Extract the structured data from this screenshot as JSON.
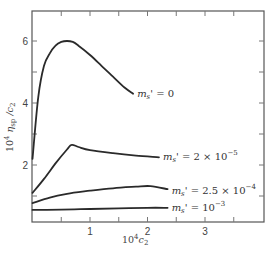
{
  "chart_data": {
    "type": "line",
    "title": "",
    "xlabel": "10^4 c2",
    "ylabel": "10^4 η_sp / c2",
    "xlim": [
      0,
      4.0
    ],
    "ylim": [
      0.15,
      6.95
    ],
    "x_ticks_major": [
      1,
      2,
      3
    ],
    "x_ticks_minor": [
      0.5,
      1.5,
      2.5,
      3.5
    ],
    "y_ticks_major": [
      2,
      4,
      6
    ],
    "y_ticks_minor": [
      1,
      3,
      5
    ],
    "grid": false,
    "legend": "inline labels at curve ends",
    "series": [
      {
        "name": "ms' = 0",
        "label_main": "m",
        "label_sub": "s",
        "label_rest": "' = 0",
        "x": [
          0.0,
          0.1,
          0.2,
          0.3,
          0.4,
          0.5,
          0.6,
          0.7,
          0.8,
          1.0,
          1.2,
          1.4,
          1.6,
          1.75
        ],
        "y": [
          2.2,
          4.2,
          5.2,
          5.6,
          5.85,
          5.97,
          6.0,
          5.97,
          5.85,
          5.55,
          5.2,
          4.85,
          4.5,
          4.3
        ]
      },
      {
        "name": "ms' = 2 × 10^-5",
        "label_main": "m",
        "label_sub": "s",
        "label_rest": "' = 2 × 10",
        "label_exp": "−5",
        "x": [
          0.0,
          0.2,
          0.4,
          0.6,
          0.68,
          0.8,
          1.0,
          1.4,
          1.8,
          2.2
        ],
        "y": [
          1.1,
          1.55,
          2.05,
          2.5,
          2.65,
          2.58,
          2.48,
          2.38,
          2.3,
          2.25
        ]
      },
      {
        "name": "ms' = 2.5 × 10^-4",
        "label_main": "m",
        "label_sub": "s",
        "label_rest": "' = 2.5 × 10",
        "label_exp": "−4",
        "x": [
          0.0,
          0.3,
          0.6,
          1.0,
          1.4,
          1.8,
          2.05,
          2.35
        ],
        "y": [
          0.77,
          0.95,
          1.07,
          1.17,
          1.25,
          1.3,
          1.32,
          1.22
        ]
      },
      {
        "name": "ms' = 10^-3",
        "label_main": "m",
        "label_sub": "s",
        "label_rest": "' = 10",
        "label_exp": "−3",
        "x": [
          0.0,
          0.5,
          1.0,
          1.5,
          2.0,
          2.35
        ],
        "y": [
          0.55,
          0.56,
          0.58,
          0.6,
          0.62,
          0.62
        ]
      }
    ]
  },
  "axes": {
    "y_label_prefix": "10",
    "y_label_exp": "4",
    "y_label_eta": " η",
    "y_label_eta_sub": "sp",
    "y_label_rest": " /c",
    "y_label_c_sub": "2",
    "x_label_prefix": "10",
    "x_label_exp": "4",
    "x_label_c": "c",
    "x_label_c_sub": "2",
    "x_tick_labels": [
      "1",
      "2",
      "3"
    ],
    "y_tick_labels": [
      "2",
      "4",
      "6"
    ]
  },
  "colors": {
    "line": "#2a2a2a",
    "frame": "#555555",
    "background": "#ffffff"
  }
}
